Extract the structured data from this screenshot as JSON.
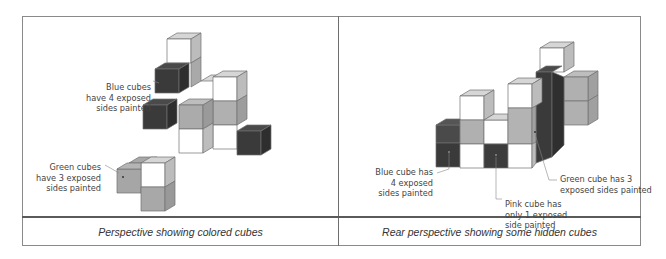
{
  "panels": [
    {
      "caption": "Perspective showing colored cubes",
      "callouts": [
        {
          "lines": [
            "Blue cubes",
            "have 4 exposed",
            "sides painted"
          ],
          "target_color": "blue"
        },
        {
          "lines": [
            "Green cubes",
            "have 3 exposed",
            "sides painted"
          ],
          "target_color": "green"
        }
      ]
    },
    {
      "caption": "Rear perspective showing some hidden cubes",
      "callouts": [
        {
          "lines": [
            "Blue cube has",
            "4 exposed",
            "sides painted"
          ],
          "target_color": "blue"
        },
        {
          "lines": [
            "Pink cube has",
            "only 1 exposed",
            "side painted"
          ],
          "target_color": "pink"
        },
        {
          "lines": [
            "Green cube has 3",
            "exposed sides painted"
          ],
          "target_color": "green"
        }
      ]
    }
  ],
  "colors": {
    "white_top": "#d4d4d4",
    "white_left": "#ffffff",
    "white_right": "#bdbdbd",
    "green_top": "#b9b9b9",
    "green_left": "#a8a8a8",
    "green_right": "#999999",
    "blue_top": "#4a4a4a",
    "blue_left": "#3c3c3c",
    "blue_right": "#303030",
    "border": "#8a8a8a"
  }
}
